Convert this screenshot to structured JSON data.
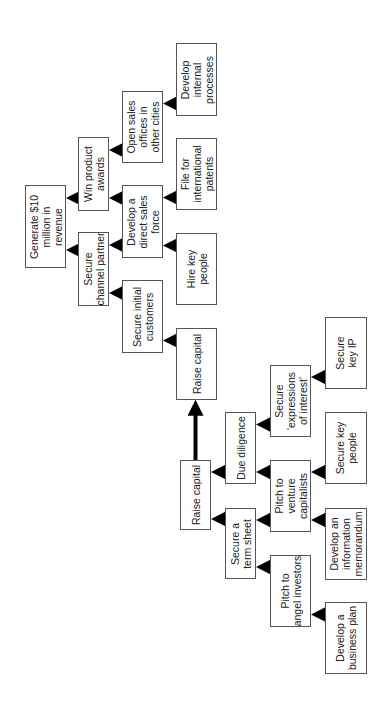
{
  "diagram": {
    "orientation": "rotated -90 degrees; arrows point toward goal at left",
    "nodes": [
      {
        "id": "generate",
        "label": "Generate $10\nmillion in\nrevenue",
        "x": 25,
        "y": 185,
        "w": 41,
        "h": 83
      },
      {
        "id": "win_awards",
        "label": "Win product\nawards",
        "x": 78,
        "y": 137,
        "w": 31,
        "h": 74
      },
      {
        "id": "channel_partner",
        "label": "Secure\nchannel partner",
        "x": 78,
        "y": 232,
        "w": 31,
        "h": 74
      },
      {
        "id": "open_offices",
        "label": "Open sales\noffices in\nother cities",
        "x": 122,
        "y": 91,
        "w": 41,
        "h": 72
      },
      {
        "id": "direct_sales",
        "label": "Develop a\ndirect sales\nforce",
        "x": 122,
        "y": 185,
        "w": 41,
        "h": 73
      },
      {
        "id": "initial_customers",
        "label": "Secure initial\ncustomers",
        "x": 122,
        "y": 280,
        "w": 41,
        "h": 73
      },
      {
        "id": "internal_processes",
        "label": "Develop\ninternal\nprocesses",
        "x": 176,
        "y": 43,
        "w": 41,
        "h": 73
      },
      {
        "id": "intl_patents",
        "label": "File for\ninternational\npatents",
        "x": 176,
        "y": 138,
        "w": 41,
        "h": 72
      },
      {
        "id": "hire_key",
        "label": "Hire key\npeople",
        "x": 176,
        "y": 233,
        "w": 41,
        "h": 72
      },
      {
        "id": "raise_capital_2",
        "label": "Raise capital",
        "x": 176,
        "y": 328,
        "w": 41,
        "h": 72
      },
      {
        "id": "raise_capital_1",
        "label": "Raise capital",
        "x": 180,
        "y": 460,
        "w": 31,
        "h": 70
      },
      {
        "id": "due_diligence",
        "label": "Due diligence",
        "x": 225,
        "y": 412,
        "w": 31,
        "h": 72
      },
      {
        "id": "term_sheet",
        "label": "Secure a\nterm sheet",
        "x": 225,
        "y": 508,
        "w": 31,
        "h": 71
      },
      {
        "id": "expressions",
        "label": "Secure\n'expressions\nof interest'",
        "x": 270,
        "y": 365,
        "w": 41,
        "h": 72
      },
      {
        "id": "pitch_vc",
        "label": "Pitch to\nventure\ncapitalists",
        "x": 270,
        "y": 460,
        "w": 41,
        "h": 72
      },
      {
        "id": "pitch_angel",
        "label": "Pitch to\nangel investors",
        "x": 270,
        "y": 555,
        "w": 41,
        "h": 72
      },
      {
        "id": "key_ip",
        "label": "Secure\nkey IP",
        "x": 325,
        "y": 317,
        "w": 42,
        "h": 72
      },
      {
        "id": "key_people",
        "label": "Secure key\npeople",
        "x": 325,
        "y": 412,
        "w": 42,
        "h": 72
      },
      {
        "id": "info_memo",
        "label": "Develop an\ninformation\nmemorandum",
        "x": 325,
        "y": 508,
        "w": 42,
        "h": 72
      },
      {
        "id": "business_plan",
        "label": "Develop a\nbusiness plan",
        "x": 325,
        "y": 602,
        "w": 42,
        "h": 72
      }
    ],
    "edges": [
      {
        "from": "win_awards",
        "to": "generate"
      },
      {
        "from": "channel_partner",
        "to": "generate"
      },
      {
        "from": "open_offices",
        "to": "win_awards"
      },
      {
        "from": "direct_sales",
        "to": "win_awards"
      },
      {
        "from": "direct_sales",
        "to": "channel_partner"
      },
      {
        "from": "initial_customers",
        "to": "channel_partner"
      },
      {
        "from": "internal_processes",
        "to": "open_offices"
      },
      {
        "from": "intl_patents",
        "to": "direct_sales"
      },
      {
        "from": "hire_key",
        "to": "direct_sales"
      },
      {
        "from": "raise_capital_2",
        "to": "initial_customers"
      },
      {
        "from": "raise_capital_1",
        "to": "raise_capital_2"
      },
      {
        "from": "due_diligence",
        "to": "raise_capital_1"
      },
      {
        "from": "term_sheet",
        "to": "raise_capital_1"
      },
      {
        "from": "expressions",
        "to": "due_diligence"
      },
      {
        "from": "pitch_vc",
        "to": "due_diligence"
      },
      {
        "from": "pitch_vc",
        "to": "term_sheet"
      },
      {
        "from": "pitch_angel",
        "to": "term_sheet"
      },
      {
        "from": "key_ip",
        "to": "expressions"
      },
      {
        "from": "key_people",
        "to": "pitch_vc"
      },
      {
        "from": "info_memo",
        "to": "pitch_vc"
      },
      {
        "from": "business_plan",
        "to": "pitch_angel"
      }
    ],
    "colors": {
      "border": "#555555",
      "arrow": "#000000",
      "text": "#222222",
      "background": "#ffffff"
    }
  }
}
